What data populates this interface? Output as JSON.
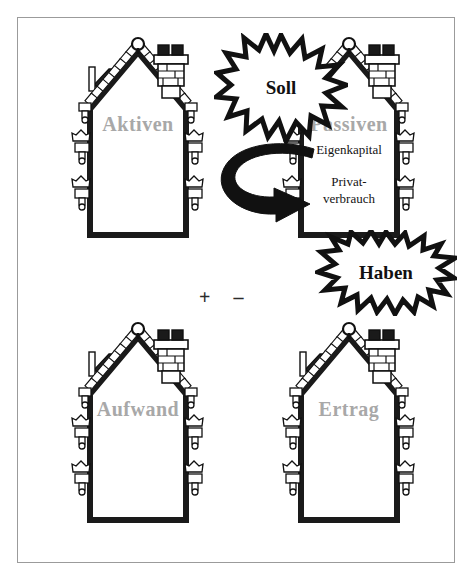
{
  "figure": {
    "frame_border_color": "#9b9b9b",
    "background": "#ffffff",
    "label_color": "#a8a8a8",
    "ink_color": "#111111"
  },
  "houses": [
    {
      "id": "aktiven",
      "label": "Aktiven",
      "lines": []
    },
    {
      "id": "passiven",
      "label": "Passiven",
      "lines": [
        "Eigenkapital",
        "Privat-",
        "verbrauch"
      ],
      "line1": "Eigenkapital",
      "line2": "Privat-",
      "line3": "verbrauch"
    },
    {
      "id": "aufwand",
      "label": "Aufwand",
      "lines": []
    },
    {
      "id": "ertrag",
      "label": "Ertrag",
      "lines": []
    }
  ],
  "bursts": [
    {
      "id": "soll",
      "text": "Soll"
    },
    {
      "id": "haben",
      "text": "Haben"
    }
  ],
  "signs": {
    "text": "+  –",
    "plus": "+",
    "minus": "–"
  },
  "icons": {
    "arrow": "curved-arrow-icon",
    "roof": "roof-tiles-icon",
    "chimney": "chimney-icon",
    "finial": "roof-finial-icon",
    "dormer": "dormer-icon",
    "flowerbox": "flower-box-icon"
  }
}
